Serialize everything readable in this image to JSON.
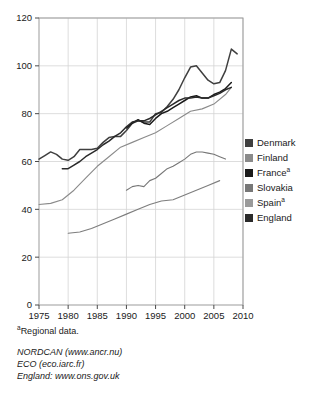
{
  "chart_data": {
    "type": "line",
    "title": "",
    "xlabel": "",
    "ylabel": "",
    "xlim": [
      1975,
      2010
    ],
    "ylim": [
      0,
      120
    ],
    "yticks": [
      0,
      20,
      40,
      60,
      80,
      100,
      120
    ],
    "xticks": [
      1975,
      1980,
      1985,
      1990,
      1995,
      2000,
      2005,
      2010
    ],
    "grid": true,
    "legend_position": "right",
    "series": [
      {
        "name": "Denmark",
        "color": "#3f3f3f",
        "x": [
          1975,
          1976,
          1977,
          1978,
          1979,
          1980,
          1981,
          1982,
          1983,
          1984,
          1985,
          1986,
          1987,
          1988,
          1989,
          1990,
          1991,
          1992,
          1993,
          1994,
          1995,
          1996,
          1997,
          1998,
          1999,
          2000,
          2001,
          2002,
          2003,
          2004,
          2005,
          2006,
          2007,
          2008,
          2009
        ],
        "values": [
          61,
          62.5,
          64,
          63,
          61,
          60.5,
          62,
          65,
          65,
          65,
          65.5,
          68,
          70,
          70.5,
          70.5,
          73,
          76,
          77,
          76.5,
          76.5,
          80,
          80.5,
          83,
          86,
          90,
          95,
          99.5,
          100,
          97,
          94,
          92.5,
          93,
          98,
          107,
          105
        ]
      },
      {
        "name": "Finland",
        "color": "#8a8a8a",
        "x": [
          1975,
          1977,
          1979,
          1981,
          1983,
          1985,
          1987,
          1989,
          1991,
          1993,
          1995,
          1997,
          1999,
          2001,
          2003,
          2005,
          2007,
          2008
        ],
        "values": [
          42,
          42.5,
          44,
          48,
          53,
          58,
          62,
          66,
          68,
          70,
          72,
          75,
          78,
          81,
          82,
          84,
          88,
          91
        ]
      },
      {
        "name": "France",
        "color": "#1a1a1a",
        "x": [
          1990,
          1991,
          1992,
          1993,
          1994,
          1995,
          1996,
          1997,
          1998,
          1999,
          2000,
          2001,
          2002,
          2003,
          2004,
          2005,
          2006,
          2007,
          2008
        ],
        "values": [
          74,
          76,
          77.5,
          76,
          75.5,
          78,
          80,
          81,
          82.5,
          84,
          85.5,
          87,
          87.5,
          86.5,
          86.5,
          88,
          89,
          90.5,
          93
        ]
      },
      {
        "name": "Slovakia",
        "color": "#777777",
        "x": [
          1990,
          1991,
          1992,
          1993,
          1994,
          1995,
          1996,
          1997,
          1998,
          1999,
          2000,
          2001,
          2002,
          2003,
          2004,
          2005,
          2006,
          2007
        ],
        "values": [
          48,
          49.5,
          50,
          49.5,
          52,
          53,
          55,
          57,
          58,
          59.5,
          61,
          63,
          64,
          64,
          63.5,
          63,
          62,
          61
        ]
      },
      {
        "name": "Spain",
        "color": "#7d7d7d",
        "x": [
          1980,
          1982,
          1984,
          1986,
          1988,
          1990,
          1992,
          1994,
          1996,
          1998,
          2000,
          2002,
          2004,
          2006
        ],
        "values": [
          30,
          30.5,
          32,
          34,
          36,
          38,
          40,
          42,
          43.5,
          44,
          46,
          48,
          50,
          52
        ]
      },
      {
        "name": "England",
        "color": "#2a2a2a",
        "x": [
          1979,
          1980,
          1981,
          1982,
          1983,
          1984,
          1985,
          1986,
          1987,
          1988,
          1989,
          1990,
          1991,
          1992,
          1993,
          1994,
          1995,
          1996,
          1997,
          1998,
          1999,
          2000,
          2001,
          2002,
          2003,
          2004,
          2005,
          2006,
          2007,
          2008
        ],
        "values": [
          57,
          57,
          58.5,
          60,
          62,
          63.5,
          65,
          67,
          68.5,
          70.5,
          72,
          74.5,
          76.5,
          77,
          77,
          78,
          79.5,
          81,
          82.5,
          84,
          85.5,
          86.5,
          86.5,
          87,
          86.5,
          86.5,
          87.5,
          88.5,
          90,
          91
        ]
      }
    ]
  },
  "legend": {
    "items": [
      {
        "label": "Denmark",
        "sup": "",
        "color": "#3f3f3f"
      },
      {
        "label": "Finland",
        "sup": "",
        "color": "#8a8a8a"
      },
      {
        "label": "France",
        "sup": "a",
        "color": "#1a1a1a"
      },
      {
        "label": "Slovakia",
        "sup": "",
        "color": "#777777"
      },
      {
        "label": "Spain",
        "sup": "a",
        "color": "#9a9a9a"
      },
      {
        "label": "England",
        "sup": "",
        "color": "#2a2a2a"
      }
    ]
  },
  "notes": {
    "footnote_marker": "a",
    "footnote_text": "Regional data.",
    "sources": [
      "NORDCAN (www.ancr.nu)",
      "ECO (eco.iarc.fr)",
      "England: www.ons.gov.uk"
    ]
  }
}
